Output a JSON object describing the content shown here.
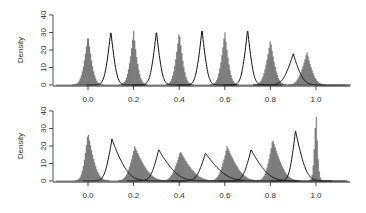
{
  "chart_data": [
    {
      "panel": "top",
      "type": "histogram+line",
      "title": "",
      "xlabel": "",
      "ylabel": "Density",
      "ylim": [
        0,
        40
      ],
      "xlim": [
        -0.15,
        1.15
      ],
      "y_ticks": [
        "0",
        "10",
        "20",
        "30",
        "40"
      ],
      "x_ticks": [
        "0.0",
        "0.2",
        "0.4",
        "0.6",
        "0.8",
        "1.0"
      ],
      "grid": false,
      "legend": null,
      "series": [
        {
          "name": "histogram (gray filled)",
          "style": "filled",
          "color": "#7a7a7a",
          "peaks": [
            {
              "center": 0.0,
              "height": 29,
              "width": 0.018,
              "skew": 0
            },
            {
              "center": 0.2,
              "height": 31,
              "width": 0.017,
              "skew": 0
            },
            {
              "center": 0.4,
              "height": 31,
              "width": 0.017,
              "skew": 0
            },
            {
              "center": 0.6,
              "height": 31,
              "width": 0.017,
              "skew": 0
            },
            {
              "center": 0.8,
              "height": 26,
              "width": 0.02,
              "skew": 0
            },
            {
              "center": 0.96,
              "height": 19,
              "width": 0.024,
              "skew": 0
            }
          ]
        },
        {
          "name": "density line (black)",
          "style": "line",
          "color": "#111111",
          "peaks": [
            {
              "center": 0.1,
              "height": 31,
              "width": 0.017,
              "skew": 0
            },
            {
              "center": 0.3,
              "height": 31,
              "width": 0.017,
              "skew": 0
            },
            {
              "center": 0.5,
              "height": 32,
              "width": 0.017,
              "skew": 0
            },
            {
              "center": 0.7,
              "height": 32,
              "width": 0.017,
              "skew": 0
            },
            {
              "center": 0.9,
              "height": 18,
              "width": 0.028,
              "skew": 0
            }
          ]
        }
      ]
    },
    {
      "panel": "bottom",
      "type": "histogram+line",
      "title": "",
      "xlabel": "",
      "ylabel": "Density",
      "ylim": [
        0,
        40
      ],
      "xlim": [
        -0.15,
        1.15
      ],
      "y_ticks": [
        "0",
        "10",
        "20",
        "30",
        "40"
      ],
      "x_ticks": [
        "0.0",
        "0.2",
        "0.4",
        "0.6",
        "0.8",
        "1.0"
      ],
      "grid": false,
      "legend": null,
      "series": [
        {
          "name": "histogram (gray filled)",
          "style": "filled",
          "color": "#7a7a7a",
          "peaks": [
            {
              "center": 0.0,
              "height": 28,
              "width": 0.016,
              "skew": 0.4
            },
            {
              "center": 0.205,
              "height": 20,
              "width": 0.022,
              "skew": 0.6
            },
            {
              "center": 0.405,
              "height": 17,
              "width": 0.024,
              "skew": 0.6
            },
            {
              "center": 0.61,
              "height": 20,
              "width": 0.022,
              "skew": 0.6
            },
            {
              "center": 0.81,
              "height": 24,
              "width": 0.02,
              "skew": 0.5
            },
            {
              "center": 1.0,
              "height": 41,
              "width": 0.008,
              "skew": 0
            }
          ]
        },
        {
          "name": "density line (black)",
          "style": "line",
          "color": "#111111",
          "peaks": [
            {
              "center": 0.105,
              "height": 24,
              "width": 0.02,
              "skew": 0.8
            },
            {
              "center": 0.31,
              "height": 18,
              "width": 0.022,
              "skew": 0.9
            },
            {
              "center": 0.515,
              "height": 16,
              "width": 0.024,
              "skew": 0.9
            },
            {
              "center": 0.715,
              "height": 18,
              "width": 0.022,
              "skew": 0.8
            },
            {
              "center": 0.91,
              "height": 29,
              "width": 0.017,
              "skew": 0.5
            }
          ]
        }
      ]
    }
  ],
  "labels": {
    "top_ylabel": "Density",
    "bottom_ylabel": "Density"
  }
}
